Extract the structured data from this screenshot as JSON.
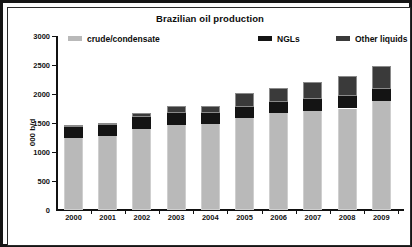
{
  "chart_data": {
    "type": "bar",
    "stacked": true,
    "title": "Brazilian oil production",
    "xlabel": "",
    "ylabel": "000 b/d",
    "ylim": [
      0,
      3000
    ],
    "yticks": [
      0,
      500,
      1000,
      1500,
      2000,
      2500,
      3000
    ],
    "grid": false,
    "legend_position": "top",
    "categories": [
      "2000",
      "2001",
      "2002",
      "2003",
      "2004",
      "2005",
      "2006",
      "2007",
      "2008",
      "2009"
    ],
    "series": [
      {
        "name": "crude/condensate",
        "color": "#b9b9b9",
        "values": [
          1240,
          1270,
          1400,
          1470,
          1480,
          1580,
          1670,
          1700,
          1750,
          1880
        ]
      },
      {
        "name": "NGLs",
        "color": "#141414",
        "values": [
          190,
          190,
          200,
          200,
          200,
          200,
          200,
          210,
          210,
          210
        ]
      },
      {
        "name": "Other liquids",
        "color": "#3a3a3a",
        "values": [
          30,
          40,
          70,
          120,
          110,
          230,
          240,
          290,
          350,
          390
        ]
      }
    ],
    "totals": [
      1460,
      1500,
      1670,
      1790,
      1790,
      2010,
      2110,
      2200,
      2310,
      2480
    ]
  },
  "legend": {
    "items": [
      {
        "label": "crude/condensate",
        "color": "#b9b9b9"
      },
      {
        "label": "NGLs",
        "color": "#141414"
      },
      {
        "label": "Other liquids",
        "color": "#3a3a3a"
      }
    ]
  }
}
